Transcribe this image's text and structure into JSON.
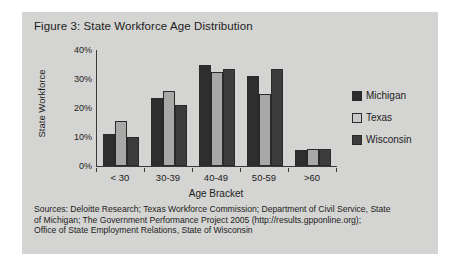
{
  "figure": {
    "title": "Figure 3: State Workforce Age Distribution"
  },
  "chart_data": {
    "type": "bar",
    "title": "Figure 3: State Workforce Age Distribution",
    "xlabel": "Age Bracket",
    "ylabel": "State Workforce",
    "categories": [
      "< 30",
      "30-39",
      "40-49",
      "50-59",
      ">60"
    ],
    "series": [
      {
        "name": "Michigan",
        "color": "#2e2e2e",
        "values": [
          11,
          23.5,
          35,
          31,
          5.5
        ]
      },
      {
        "name": "Texas",
        "color": "#a8a8a6",
        "values": [
          15.5,
          26,
          32.5,
          25,
          6
        ]
      },
      {
        "name": "Wisconsin",
        "color": "#3c3c3c",
        "values": [
          10,
          21,
          33.5,
          33.5,
          6
        ]
      }
    ],
    "ylim": [
      0,
      40
    ],
    "ytick_labels": [
      "40%",
      "30%",
      "20%",
      "10%",
      "0%"
    ],
    "ytick_values": [
      40,
      30,
      20,
      10,
      0
    ],
    "grid": false,
    "legend_position": "right"
  },
  "legend": {
    "items": [
      {
        "label": "Michigan"
      },
      {
        "label": "Texas"
      },
      {
        "label": "Wisconsin"
      }
    ]
  },
  "sources": {
    "line1": "Sources: Deloitte Research; Texas Workforce Commission; Department of Civil Service, State",
    "line2": "of Michigan; The Government Performance Project 2005 (http://results.gpponline.org);",
    "line3": "Office of State Employment Relations, State of Wisconsin"
  }
}
